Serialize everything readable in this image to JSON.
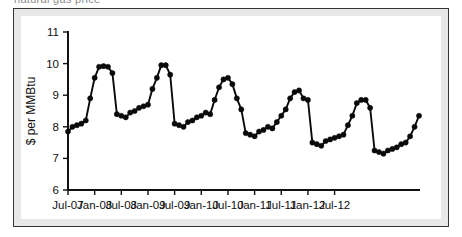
{
  "figure": {
    "top_text_remnant": "natural gas price",
    "frame_border_color": "#343434",
    "frame_fill_color": "#e8e8e8",
    "plot_background_color": "#ffffff"
  },
  "chart_data": {
    "type": "line",
    "title": "",
    "subtitle": "",
    "xlabel": "",
    "ylabel": "$ per MMBtu",
    "ylim": [
      6,
      11
    ],
    "ytick_labels": [
      "6",
      "7",
      "8",
      "9",
      "10",
      "11"
    ],
    "ytick_values": [
      6,
      7,
      8,
      9,
      10,
      11
    ],
    "xtick_labels": [
      "Jul-07",
      "Jan-08",
      "Jul-08",
      "Jan-09",
      "Jul-09",
      "Jan-10",
      "Jul-10",
      "Jan-11",
      "Jul-11",
      "Jan-12",
      "Jul-12"
    ],
    "xtick_values": [
      0,
      6,
      12,
      18,
      24,
      30,
      36,
      42,
      48,
      54,
      60
    ],
    "grid": false,
    "legend": "none",
    "line_color": "#0a0a0a",
    "marker": "circle",
    "marker_color": "#0a0a0a",
    "x": [
      0,
      1,
      2,
      3,
      4,
      5,
      6,
      7,
      8,
      9,
      10,
      11,
      12,
      13,
      14,
      15,
      16,
      17,
      18,
      19,
      20,
      21,
      22,
      23,
      24,
      25,
      26,
      27,
      28,
      29,
      30,
      31,
      32,
      33,
      34,
      35,
      36,
      37,
      38,
      39,
      40,
      41,
      42,
      43,
      44,
      45,
      46,
      47,
      48,
      49,
      50,
      51,
      52,
      53,
      54,
      55,
      56,
      57,
      58,
      59,
      60,
      61,
      62,
      63,
      64
    ],
    "x_labels": [
      "Jul-07",
      "Aug-07",
      "Sep-07",
      "Oct-07",
      "Nov-07",
      "Dec-07",
      "Jan-08",
      "Feb-08",
      "Mar-08",
      "Apr-08",
      "May-08",
      "Jun-08",
      "Jul-08",
      "Aug-08",
      "Sep-08",
      "Oct-08",
      "Nov-08",
      "Dec-08",
      "Jan-09",
      "Feb-09",
      "Mar-09",
      "Apr-09",
      "May-09",
      "Jun-09",
      "Jul-09",
      "Aug-09",
      "Sep-09",
      "Oct-09",
      "Nov-09",
      "Dec-09",
      "Jan-10",
      "Feb-10",
      "Mar-10",
      "Apr-10",
      "May-10",
      "Jun-10",
      "Jul-10",
      "Aug-10",
      "Sep-10",
      "Oct-10",
      "Nov-10",
      "Dec-10",
      "Jan-11",
      "Feb-11",
      "Mar-11",
      "Apr-11",
      "May-11",
      "Jun-11",
      "Jul-11",
      "Aug-11",
      "Sep-11",
      "Oct-11",
      "Nov-11",
      "Dec-11",
      "Jan-12",
      "Feb-12",
      "Mar-12",
      "Apr-12",
      "May-12",
      "Jun-12",
      "Jul-12",
      "Aug-12",
      "Sep-12",
      "Oct-12",
      "Nov-12"
    ],
    "values": [
      7.85,
      8.0,
      8.05,
      8.1,
      8.2,
      8.9,
      9.55,
      9.9,
      9.92,
      9.9,
      9.7,
      8.4,
      8.35,
      8.3,
      8.45,
      8.5,
      8.6,
      8.65,
      8.7,
      9.2,
      9.55,
      9.95,
      9.95,
      9.65,
      8.1,
      8.05,
      8.0,
      8.15,
      8.2,
      8.3,
      8.35,
      8.45,
      8.4,
      8.85,
      9.25,
      9.5,
      9.55,
      9.35,
      8.9,
      8.55,
      7.8,
      7.75,
      7.7,
      7.85,
      7.9,
      8.0,
      7.95,
      8.15,
      8.35,
      8.55,
      8.9,
      9.1,
      9.15,
      8.9,
      8.85,
      7.5,
      7.45,
      7.4,
      7.55,
      7.6,
      7.65,
      7.7,
      7.75,
      8.05,
      8.35
    ],
    "values_tail": [
      8.75,
      8.85,
      8.85,
      8.6,
      7.25,
      7.2,
      7.15,
      7.25,
      7.3,
      7.35,
      7.45,
      7.5,
      7.7,
      8.0,
      8.35
    ]
  },
  "series_full": {
    "labels": [
      "Jul-07",
      "Aug-07",
      "Sep-07",
      "Oct-07",
      "Nov-07",
      "Dec-07",
      "Jan-08",
      "Feb-08",
      "Mar-08",
      "Apr-08",
      "May-08",
      "Jun-08",
      "Jul-08",
      "Aug-08",
      "Sep-08",
      "Oct-08",
      "Nov-08",
      "Dec-08",
      "Jan-09",
      "Feb-09",
      "Mar-09",
      "Apr-09",
      "May-09",
      "Jun-09",
      "Jul-09",
      "Aug-09",
      "Sep-09",
      "Oct-09",
      "Nov-09",
      "Dec-09",
      "Jan-10",
      "Feb-10",
      "Mar-10",
      "Apr-10",
      "May-10",
      "Jun-10",
      "Jul-10",
      "Aug-10",
      "Sep-10",
      "Oct-10",
      "Nov-10",
      "Dec-10",
      "Jan-11",
      "Feb-11",
      "Mar-11",
      "Apr-11",
      "May-11",
      "Jun-11",
      "Jul-11",
      "Aug-11",
      "Sep-11",
      "Oct-11",
      "Nov-11",
      "Dec-11",
      "Jan-12",
      "Feb-12",
      "Mar-12",
      "Apr-12",
      "May-12",
      "Jun-12",
      "Jul-12",
      "Aug-12",
      "Sep-12",
      "Oct-12",
      "Nov-12",
      "Dec-12",
      "Jan-13",
      "Feb-13",
      "Mar-13",
      "Apr-13"
    ],
    "values": [
      7.85,
      8.0,
      8.05,
      8.1,
      8.2,
      8.9,
      9.55,
      9.9,
      9.92,
      9.9,
      9.7,
      8.4,
      8.35,
      8.3,
      8.45,
      8.5,
      8.6,
      8.65,
      8.7,
      9.2,
      9.55,
      9.95,
      9.95,
      9.65,
      8.1,
      8.05,
      8.0,
      8.15,
      8.2,
      8.3,
      8.35,
      8.45,
      8.4,
      8.85,
      9.25,
      9.5,
      9.55,
      9.35,
      8.9,
      8.55,
      7.8,
      7.75,
      7.7,
      7.85,
      7.9,
      8.0,
      7.95,
      8.15,
      8.35,
      8.55,
      8.9,
      9.1,
      9.15,
      8.9,
      8.85,
      7.5,
      7.45,
      7.4,
      7.55,
      7.6,
      7.65,
      7.7,
      7.75,
      8.05,
      8.35,
      8.75,
      8.85,
      8.85,
      8.6,
      7.25
    ]
  }
}
